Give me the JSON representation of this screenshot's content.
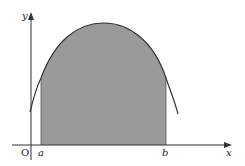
{
  "diagram": {
    "type": "area-under-curve",
    "labels": {
      "y_axis": "y",
      "x_axis": "x",
      "origin": "O",
      "a": "a",
      "b": "b"
    },
    "colors": {
      "axis": "#333333",
      "curve": "#333333",
      "fill": "#9a9a9a",
      "background": "#ffffff"
    },
    "shaded_region": {
      "from": "a",
      "to": "b",
      "description": "Area between curve and x-axis from x=a to x=b"
    }
  }
}
